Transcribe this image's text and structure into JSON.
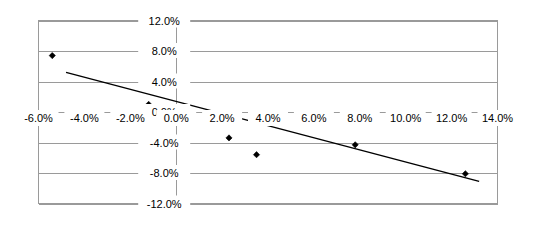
{
  "chart_data": {
    "type": "scatter",
    "title": "",
    "xlabel": "",
    "ylabel": "",
    "xlim": [
      -6.0,
      14.0
    ],
    "ylim": [
      -12.0,
      12.0
    ],
    "grid": true,
    "legend": "none",
    "x_ticks": [
      -6.0,
      -4.0,
      -2.0,
      0.0,
      2.0,
      4.0,
      6.0,
      8.0,
      10.0,
      12.0,
      14.0
    ],
    "x_tick_labels": [
      "-6.0%",
      "-4.0%",
      "-2.0%",
      "0.0%",
      "2.0%",
      "4.0%",
      "6.0%",
      "8.0%",
      "10.0%",
      "12.0%",
      "14.0%"
    ],
    "y_ticks": [
      12.0,
      8.0,
      4.0,
      0.0,
      -4.0,
      -8.0,
      -12.0
    ],
    "y_tick_labels": [
      "12.0%",
      "8.0%",
      "4.0%",
      "0.0%",
      "-4.0%",
      "-8.0%",
      "-12.0%"
    ],
    "series": [
      {
        "name": "observations",
        "marker": "diamond",
        "color": "#000000",
        "points": [
          {
            "x": -5.4,
            "y": 7.4
          },
          {
            "x": -1.2,
            "y": 1.0
          },
          {
            "x": 2.3,
            "y": -3.4
          },
          {
            "x": 3.5,
            "y": -5.6
          },
          {
            "x": 7.8,
            "y": -4.3
          },
          {
            "x": 12.6,
            "y": -8.1
          }
        ]
      }
    ],
    "trendline": {
      "name": "linear-fit",
      "color": "#000000",
      "x_start": -4.8,
      "y_start": 5.2,
      "x_end": 13.2,
      "y_end": -9.1
    }
  },
  "axis": {
    "zero_vertical_label": "0.0%"
  }
}
